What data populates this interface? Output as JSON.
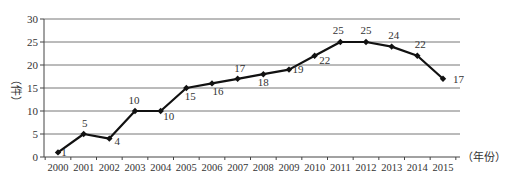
{
  "chart_data": {
    "type": "line",
    "title": "",
    "xlabel": "（年份）",
    "ylabel": "（件）",
    "ylim": [
      0,
      30
    ],
    "yticks": [
      0,
      5,
      10,
      15,
      20,
      25,
      30
    ],
    "grid": true,
    "legend": null,
    "categories": [
      "2000",
      "2001",
      "2002",
      "2003",
      "2004",
      "2005",
      "2006",
      "2007",
      "2008",
      "2009",
      "2010",
      "2011",
      "2012",
      "2013",
      "2014",
      "2015"
    ],
    "series": [
      {
        "name": "件数",
        "values": [
          1,
          5,
          4,
          10,
          10,
          15,
          16,
          17,
          18,
          19,
          22,
          25,
          25,
          24,
          22,
          17
        ]
      }
    ],
    "data_labels": [
      "1",
      "5",
      "4",
      "10",
      "10",
      "15",
      "16",
      "17",
      "18",
      "19",
      "22",
      "25",
      "25",
      "24",
      "22",
      "17"
    ]
  },
  "colors": {
    "line": "#111111",
    "grid": "#777777",
    "text": "#333333"
  }
}
